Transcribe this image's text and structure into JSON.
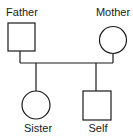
{
  "diagram": {
    "type": "pedigree",
    "members": [
      {
        "id": "father",
        "label": "Father",
        "sex": "male",
        "shape": "square",
        "generation": 1
      },
      {
        "id": "mother",
        "label": "Mother",
        "sex": "female",
        "shape": "circle",
        "generation": 1
      },
      {
        "id": "sister",
        "label": "Sister",
        "sex": "female",
        "shape": "circle",
        "generation": 2
      },
      {
        "id": "self",
        "label": "Self",
        "sex": "male",
        "shape": "square",
        "generation": 2
      }
    ],
    "relationships": [
      {
        "type": "marriage",
        "between": [
          "father",
          "mother"
        ]
      },
      {
        "type": "offspring",
        "parents": [
          "father",
          "mother"
        ],
        "children": [
          "sister",
          "self"
        ]
      }
    ],
    "colors": {
      "stroke": "#1a1a1a",
      "fill": "#ffffff"
    }
  }
}
